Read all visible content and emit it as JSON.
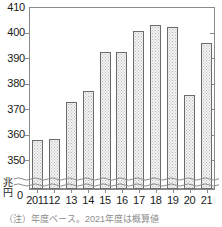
{
  "chart_data": {
    "type": "bar",
    "title": "",
    "subtitle": "",
    "xlabel": "",
    "ylabel": "兆円",
    "unit_label_chars": [
      "兆",
      "円"
    ],
    "categories": [
      "2011",
      "12",
      "13",
      "14",
      "15",
      "16",
      "17",
      "18",
      "19",
      "20",
      "21"
    ],
    "values": [
      358.0,
      358.5,
      373.0,
      377.0,
      392.5,
      392.5,
      400.5,
      403.0,
      402.0,
      375.5,
      396.0
    ],
    "ylim": [
      345,
      410
    ],
    "yticks": [
      350,
      360,
      370,
      380,
      390,
      400,
      410
    ],
    "ytick_labels": [
      "350",
      "360",
      "370",
      "380",
      "390",
      "400",
      "410"
    ],
    "zero_tick_label": "0",
    "axis_break": true,
    "grid": false,
    "legend": null,
    "colors": {
      "bar_fill": "#f4f4f4",
      "bar_pattern": "#b9b9b9",
      "bar_outline": "#6b6b6b",
      "axis": "#8a8a8a",
      "text": "#1a1a1a",
      "background": "#ffffff"
    }
  },
  "footnote": {
    "text": "（注）年度ベース。2021年度は概算値"
  }
}
